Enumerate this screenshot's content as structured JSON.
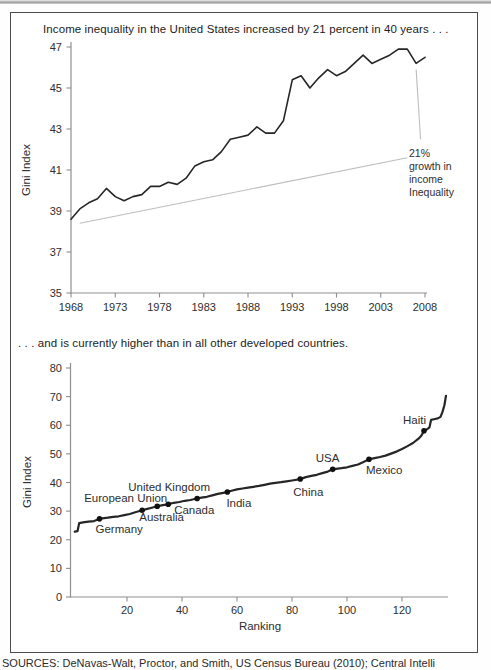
{
  "source_note": "SOURCES: DeNavas-Walt, Proctor, and Smith, US Census Bureau (2010); Central Intelli",
  "colors": {
    "data_line": "#262626",
    "axis": "#8f8f8f",
    "annotation_line": "#bdbdbd",
    "tick_text": "#2e2e2e",
    "marker": "#111111"
  },
  "chart_data": [
    {
      "type": "line",
      "title": "Income inequality in the United States increased by 21 percent in 40 years . . .",
      "xlabel": "",
      "ylabel": "Gini Index",
      "xlim": [
        1968,
        2008
      ],
      "ylim": [
        35,
        47
      ],
      "xticks": [
        1968,
        1973,
        1978,
        1983,
        1988,
        1993,
        1998,
        2003,
        2008
      ],
      "yticks": [
        35,
        37,
        39,
        41,
        43,
        45,
        47
      ],
      "grid": false,
      "legend": false,
      "x": [
        1968,
        1969,
        1970,
        1971,
        1972,
        1973,
        1974,
        1975,
        1976,
        1977,
        1978,
        1979,
        1980,
        1981,
        1982,
        1983,
        1984,
        1985,
        1986,
        1987,
        1988,
        1989,
        1990,
        1991,
        1992,
        1993,
        1994,
        1995,
        1996,
        1997,
        1998,
        1999,
        2000,
        2001,
        2002,
        2003,
        2004,
        2005,
        2006,
        2007,
        2008
      ],
      "values": [
        38.6,
        39.1,
        39.4,
        39.6,
        40.1,
        39.7,
        39.5,
        39.7,
        39.8,
        40.2,
        40.2,
        40.4,
        40.3,
        40.6,
        41.2,
        41.4,
        41.5,
        41.9,
        42.5,
        42.6,
        42.7,
        43.1,
        42.8,
        42.8,
        43.4,
        45.4,
        45.6,
        45.0,
        45.5,
        45.9,
        45.6,
        45.8,
        46.2,
        46.6,
        46.2,
        46.4,
        46.6,
        46.9,
        46.9,
        46.2,
        46.5
      ],
      "trend_line": {
        "x1": 1969,
        "y1": 38.4,
        "x2": 2006,
        "y2": 41.6
      },
      "callout_line": {
        "x1": 2007,
        "y1": 45.9,
        "x2": 2007.5,
        "y2": 42.5
      },
      "annotation": {
        "text": "21%\ngrowth in\nincome\nInequality"
      }
    },
    {
      "type": "line",
      "title": ". . . and is currently higher than in all other developed countries.",
      "xlabel": "Ranking",
      "ylabel": "Gini Index",
      "xlim": [
        0,
        137
      ],
      "ylim": [
        0,
        80
      ],
      "xticks": [
        20,
        40,
        60,
        80,
        100,
        120
      ],
      "yticks": [
        0,
        10,
        20,
        30,
        40,
        50,
        60,
        70,
        80
      ],
      "grid": false,
      "legend": false,
      "curve": [
        [
          1,
          22.8
        ],
        [
          2,
          23.0
        ],
        [
          2.6,
          25.8
        ],
        [
          4,
          26.1
        ],
        [
          6,
          26.3
        ],
        [
          8,
          26.5
        ],
        [
          10,
          27.3
        ],
        [
          11,
          27.5
        ],
        [
          13,
          27.7
        ],
        [
          15,
          28.0
        ],
        [
          17,
          28.2
        ],
        [
          19,
          28.6
        ],
        [
          21,
          29.0
        ],
        [
          23,
          29.6
        ],
        [
          25.5,
          30.3
        ],
        [
          27,
          30.7
        ],
        [
          29,
          31.2
        ],
        [
          31,
          31.7
        ],
        [
          33,
          32.1
        ],
        [
          35,
          32.4
        ],
        [
          37,
          32.9
        ],
        [
          39,
          33.2
        ],
        [
          41,
          33.6
        ],
        [
          43,
          33.9
        ],
        [
          45.5,
          34.4
        ],
        [
          47,
          34.7
        ],
        [
          49,
          35.0
        ],
        [
          51,
          35.5
        ],
        [
          53,
          36.0
        ],
        [
          55,
          36.4
        ],
        [
          56.5,
          36.7
        ],
        [
          58,
          37.1
        ],
        [
          60,
          37.6
        ],
        [
          62,
          37.9
        ],
        [
          64,
          38.2
        ],
        [
          66,
          38.5
        ],
        [
          68,
          38.8
        ],
        [
          70,
          39.2
        ],
        [
          72,
          39.6
        ],
        [
          74,
          39.9
        ],
        [
          76,
          40.1
        ],
        [
          78,
          40.4
        ],
        [
          80,
          40.7
        ],
        [
          83,
          41.2
        ],
        [
          85,
          41.9
        ],
        [
          87,
          42.3
        ],
        [
          89,
          42.7
        ],
        [
          91,
          43.3
        ],
        [
          93,
          43.8
        ],
        [
          94.8,
          44.6
        ],
        [
          96,
          44.8
        ],
        [
          98,
          45.0
        ],
        [
          100,
          45.3
        ],
        [
          102,
          45.8
        ],
        [
          104,
          46.3
        ],
        [
          106,
          47.2
        ],
        [
          108,
          48.1
        ],
        [
          110,
          48.5
        ],
        [
          112,
          48.9
        ],
        [
          114,
          49.4
        ],
        [
          116,
          50.1
        ],
        [
          118,
          50.8
        ],
        [
          120,
          51.7
        ],
        [
          122,
          52.7
        ],
        [
          124,
          53.8
        ],
        [
          126,
          55.3
        ],
        [
          127,
          56.3
        ],
        [
          128,
          58.1
        ],
        [
          129,
          58.5
        ],
        [
          130,
          59.3
        ],
        [
          130.6,
          61.9
        ],
        [
          132,
          62.2
        ],
        [
          133,
          62.4
        ],
        [
          134,
          62.9
        ],
        [
          134.7,
          64.6
        ],
        [
          135.4,
          67.0
        ],
        [
          136,
          70.3
        ]
      ],
      "points": [
        {
          "name": "Germany",
          "rank": 10,
          "gini": 27.3,
          "label_dx": -4,
          "label_dy": 14
        },
        {
          "name": "European Union",
          "rank": 25.5,
          "gini": 30.3,
          "label_dx": -58,
          "label_dy": -8
        },
        {
          "name": "Australia",
          "rank": 31,
          "gini": 31.7,
          "label_dx": -18,
          "label_dy": 15
        },
        {
          "name": "United Kingdom",
          "rank": 35,
          "gini": 32.4,
          "label_dx": -40,
          "label_dy": -13
        },
        {
          "name": "Canada",
          "rank": 45.5,
          "gini": 34.4,
          "label_dx": -23,
          "label_dy": 15
        },
        {
          "name": "India",
          "rank": 56.5,
          "gini": 36.7,
          "label_dx": -1,
          "label_dy": 15
        },
        {
          "name": "China",
          "rank": 83,
          "gini": 41.2,
          "label_dx": -7,
          "label_dy": 17
        },
        {
          "name": "USA",
          "rank": 94.8,
          "gini": 44.6,
          "label_dx": -17,
          "label_dy": -7
        },
        {
          "name": "Mexico",
          "rank": 108,
          "gini": 48.1,
          "label_dx": -3,
          "label_dy": 15
        },
        {
          "name": "Haiti",
          "rank": 128,
          "gini": 58.1,
          "label_dx": -21,
          "label_dy": -7
        }
      ]
    }
  ]
}
